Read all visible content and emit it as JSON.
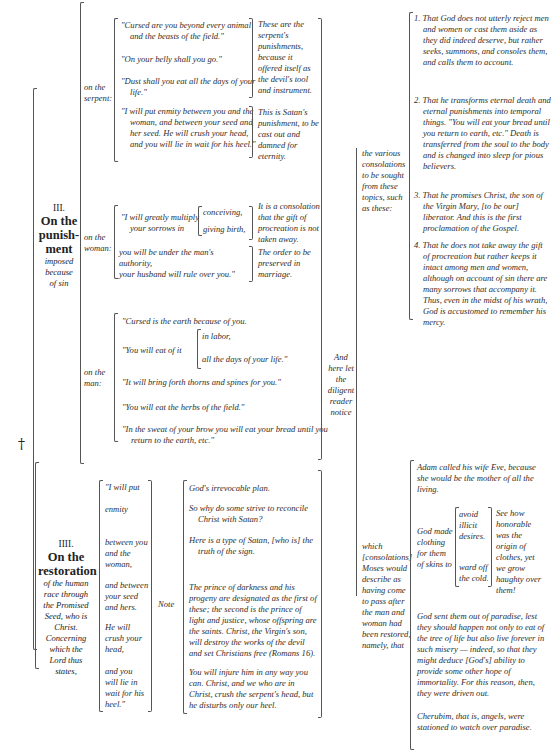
{
  "page": {
    "dagger": "†",
    "section3": {
      "number": "III.",
      "title_lines": [
        "On the",
        "punish-",
        "ment"
      ],
      "subtitle_lines": [
        "imposed",
        "because",
        "of sin"
      ],
      "serpent": {
        "label_lines": [
          "on the",
          "serpent:"
        ],
        "quotes": [
          "\"Cursed are you beyond every animal and the beasts of the field.\"",
          "\"On your belly shall you go.\"",
          "\"Dust shall you eat all the days of your life.\"",
          "\"I will put enmity between you and the woman, and between your seed and her seed. He will crush your head, and you will lie in wait for his heel.\""
        ],
        "gloss_1": "These are the serpent's punishments, because it offered itself as the devil's tool and instrument.",
        "gloss_2": "This is Satan's punishment, to be cast out and damned for eternity."
      },
      "woman": {
        "label_lines": [
          "on the",
          "woman:"
        ],
        "quote_1": "\"I will greatly multiply your sorrows in",
        "quote_1_options": [
          "conceiving,",
          "giving birth,"
        ],
        "gloss_1": "It is a consolation that the gift of procreation is not taken away.",
        "quote_2a": "you will be under the man's authority,",
        "quote_2b": "your husband will rule over you.\"",
        "gloss_2": "The order to be preserved in marriage."
      },
      "man": {
        "label_lines": [
          "on the",
          "man:"
        ],
        "quote_1": "\"Cursed is the earth because of you.",
        "quote_2": "\"You will eat of it",
        "quote_2_options": [
          "in labor,",
          "all the days of your life.\""
        ],
        "quote_3": "\"It will bring forth thorns and spines for you.\"",
        "quote_4": "\"You will eat the herbs of the field.\"",
        "quote_5": "\"In the sweat of your brow you will eat your bread until you return to the earth, etc.\""
      }
    },
    "reader_notice_lines": [
      "And",
      "here let",
      "the",
      "diligent",
      "reader",
      "notice"
    ],
    "consolations": {
      "label_lines": [
        "the various",
        "consolations",
        "to be sought",
        "from these",
        "topics, such",
        "as these:"
      ],
      "items": [
        "1. That God does not utterly reject men and women or cast them aside as they did indeed deserve, but rather seeks, summons, and consoles them, and calls them to account.",
        "2. That he transforms eternal death and eternal punishments into temporal things. \"You will eat your bread until you return to earth, etc.\" Death is transferred from the soul to the body and is changed into sleep for pious believers.",
        "3. That he promises Christ, the son of the Virgin Mary, [to be our] liberator. And this is the first proclamation of the Gospel.",
        "4. That he does not take away the gift of procreation but rather keeps it intact among men and women, although on account of sin there are many sorrows that accompany it. Thus, even in the midst of his wrath, God is accustomed to remember his mercy."
      ]
    },
    "section4": {
      "number": "IIII.",
      "title_lines": [
        "On the",
        "restoration"
      ],
      "subtitle_lines": [
        "of the human",
        "race through",
        "the Promised",
        "Seed, who is",
        "Christ.",
        "Concerning",
        "which the",
        "Lord thus",
        "states,"
      ],
      "phrases": [
        "\"I will put",
        "enmity",
        "between you and the woman,",
        "and between your seed and hers.",
        "He will crush your head,",
        "and you will lie in wait for his heel.\""
      ],
      "note_label": "Note",
      "notes": [
        "God's irrevocable plan.",
        "So why do some strive to reconcile Christ with Satan?",
        "Here is a type of Satan, [who is] the truth of the sign.",
        "The prince of darkness and his progeny are designated as the first of these; the second is the prince of light and justice, whose offspring are the saints. Christ, the Virgin's son, will destroy the works of the devil and set Christians free (Romans 16).",
        "You will injure him in any way you can. Christ, and we who are in Christ, crush the serpent's head, but he disturbs only our heel."
      ]
    },
    "moses": {
      "label_lines": [
        "which",
        "[consolations]",
        "Moses would",
        "describe as",
        "having come",
        "to pass after",
        "the man and",
        "woman had",
        "been restored,",
        "namely, that"
      ],
      "adam_eve": "Adam called his wife Eve, because she would be the mother of all the living.",
      "clothing_label": "God made clothing for them of skins to",
      "clothing_purposes": [
        "avoid illicit desires.",
        "ward off the cold."
      ],
      "clothing_gloss": "See how honorable was the origin of clothes, yet we grow haughty over them!",
      "paradise": "God sent them out of paradise, lest they should happen not only to eat of the tree of life but also live forever in such misery — indeed, so that they might deduce [God's] ability to provide some other hope of immortality. For this reason, then, they were driven out.",
      "cherubim": "Cherubim, that is, angels, were stationed to watch over paradise."
    }
  }
}
